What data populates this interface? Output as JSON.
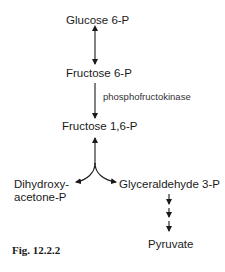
{
  "diagram": {
    "type": "metabolic-pathway",
    "nodes": {
      "glucose_6p": "Glucose 6-P",
      "fructose_6p": "Fructose 6-P",
      "fructose_16p": "Fructose 1,6-P",
      "dihydroxyacetone_p_line1": "Dihydroxy-",
      "dihydroxyacetone_p_line2": "acetone-P",
      "glyceraldehyde_3p": "Glyceraldehyde 3-P",
      "pyruvate": "Pyruvate"
    },
    "enzymes": {
      "f6p_to_f16p": "phosphofructokinase"
    },
    "edges": [
      {
        "from": "Glucose 6-P",
        "to": "Fructose 6-P",
        "direction": "bidirectional"
      },
      {
        "from": "Fructose 6-P",
        "to": "Fructose 1,6-P",
        "direction": "forward",
        "label": "phosphofructokinase"
      },
      {
        "from": "Fructose 1,6-P",
        "to": "Dihydroxyacetone-P",
        "direction": "bidirectional-branch"
      },
      {
        "from": "Fructose 1,6-P",
        "to": "Glyceraldehyde 3-P",
        "direction": "bidirectional-branch"
      },
      {
        "from": "Glyceraldehyde 3-P",
        "to": "Pyruvate",
        "direction": "forward",
        "steps": 3
      }
    ],
    "caption": "Fig. 12.2.2"
  },
  "colors": {
    "ink": "#1a1a1a",
    "background": "#ffffff"
  }
}
